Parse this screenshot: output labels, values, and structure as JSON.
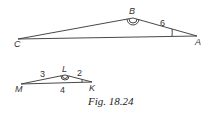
{
  "figure": {
    "caption": "Fig. 18.24",
    "triangle_abc": {
      "vertices": {
        "A": "A",
        "B": "B",
        "C": "C"
      },
      "side_labels": {
        "AB": "6"
      }
    },
    "triangle_klm": {
      "vertices": {
        "K": "K",
        "L": "L",
        "M": "M"
      },
      "side_labels": {
        "ML": "3",
        "LK": "2",
        "MK": "4"
      }
    }
  }
}
